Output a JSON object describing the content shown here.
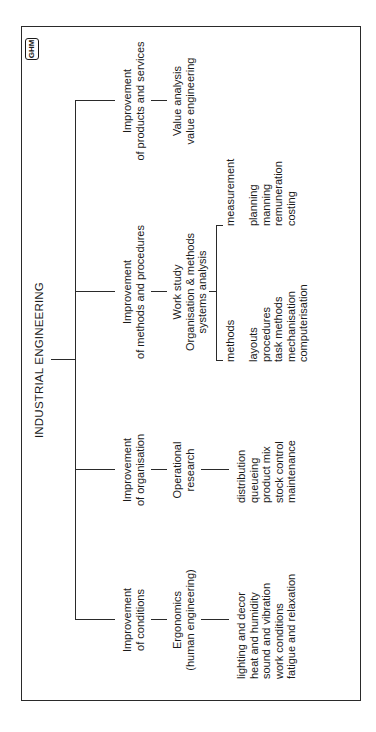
{
  "diagram": {
    "title": "INDUSTRIAL ENGINEERING",
    "logo": "GHM",
    "branches": [
      {
        "heading": [
          "Improvement",
          "of conditions"
        ],
        "technique": [
          "Ergonomics",
          "(human engineering)"
        ],
        "items": [
          "lighting and decor",
          "heat and humidity",
          "sound and vibration",
          "work conditions",
          "fatigue and relaxation"
        ]
      },
      {
        "heading": [
          "Improvement",
          "of organisation"
        ],
        "technique": [
          "Operational",
          "research"
        ],
        "items": [
          "distribution",
          "queueing",
          "product mix",
          "stock control",
          "maintenance"
        ]
      },
      {
        "heading": [
          "Improvement",
          "of methods and procedures"
        ],
        "technique": [
          "Work study",
          "Organisation & methods",
          "systems analysis"
        ],
        "sub_branches": [
          {
            "label": "methods",
            "items": [
              "layouts",
              "procedures",
              "task methods",
              "mechanisation",
              "computerisation"
            ]
          },
          {
            "label": "measurement",
            "items": [
              "planning",
              "manning",
              "remuneration",
              "costing"
            ]
          }
        ]
      },
      {
        "heading": [
          "Improvement",
          "of products and services"
        ],
        "technique": [
          "Value analysis",
          "value engineering"
        ]
      }
    ]
  }
}
